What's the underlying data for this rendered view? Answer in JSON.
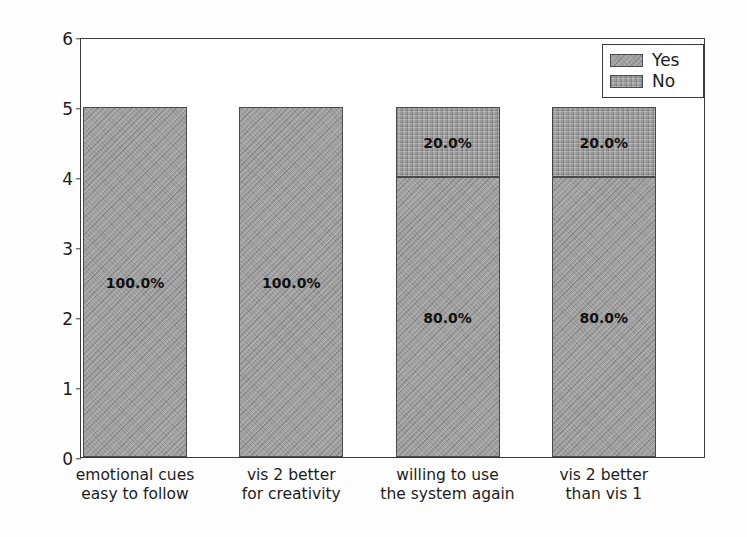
{
  "chart_data": {
    "type": "bar",
    "stacked": true,
    "title": "",
    "xlabel": "",
    "ylabel": "No of participants",
    "ylim": [
      0,
      6
    ],
    "yticks": [
      0,
      1,
      2,
      3,
      4,
      5,
      6
    ],
    "ytick_labels": [
      "0",
      "1",
      "2",
      "3",
      "4",
      "5",
      "6"
    ],
    "grid": false,
    "legend_position": "upper right",
    "categories": [
      "emotional cues\neasy to follow",
      "vis 2 better\nfor creativity",
      "willing to use\nthe system again",
      "vis 2 better\nthan vis 1"
    ],
    "category_lines": [
      [
        "emotional cues",
        "easy to follow"
      ],
      [
        "vis 2 better",
        "for creativity"
      ],
      [
        "willing to use",
        "the system again"
      ],
      [
        "vis 2 better",
        "than vis 1"
      ]
    ],
    "series": [
      {
        "name": "Yes",
        "values": [
          5,
          5,
          4,
          4
        ],
        "data_labels": [
          "100.0%",
          "100.0%",
          "80.0%",
          "80.0%"
        ],
        "color": "#9a9a9a",
        "hatch": "diagonal"
      },
      {
        "name": "No",
        "values": [
          0,
          0,
          1,
          1
        ],
        "data_labels": [
          "",
          "",
          "20.0%",
          "20.0%"
        ],
        "color": "#9a9a9a",
        "hatch": "dotted"
      }
    ]
  },
  "legend": {
    "entries": [
      {
        "label": "Yes"
      },
      {
        "label": "No"
      }
    ]
  },
  "colors": {
    "bar_fill": "#9a9a9a",
    "bar_edge": "#4a4a4a",
    "axis": "#3a3a3a",
    "text": "#1c1c1c",
    "background": "#fefefe"
  }
}
